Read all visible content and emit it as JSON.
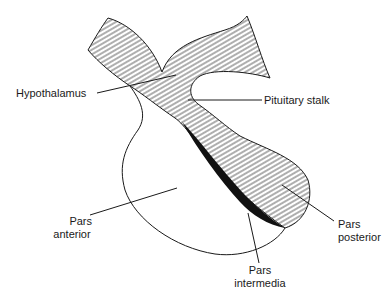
{
  "diagram": {
    "labels": {
      "hypothalamus": "Hypothalamus",
      "pituitary_stalk": "Pituitary stalk",
      "pars_anterior_1": "Pars",
      "pars_anterior_2": "anterior",
      "pars_posterior_1": "Pars",
      "pars_posterior_2": "posterior",
      "pars_intermedia_1": "Pars",
      "pars_intermedia_2": "intermedia"
    },
    "colors": {
      "line": "#1a1a1a",
      "hatch": "#333333",
      "intermedia_fill": "#111111",
      "background": "#ffffff"
    }
  }
}
